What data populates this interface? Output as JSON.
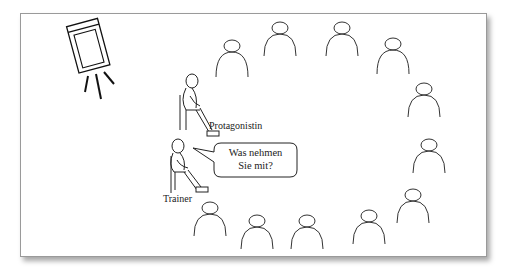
{
  "diagram": {
    "type": "seating-arrangement",
    "labels": {
      "protagonist": "Protagonistin",
      "trainer": "Trainer"
    },
    "speech_bubble": {
      "line1": "Was nehmen",
      "line2": "Sie mit?"
    },
    "audience_count": 11,
    "colors": {
      "stroke": "#333333",
      "frame_border": "#9a9a9a",
      "background": "#ffffff"
    }
  }
}
